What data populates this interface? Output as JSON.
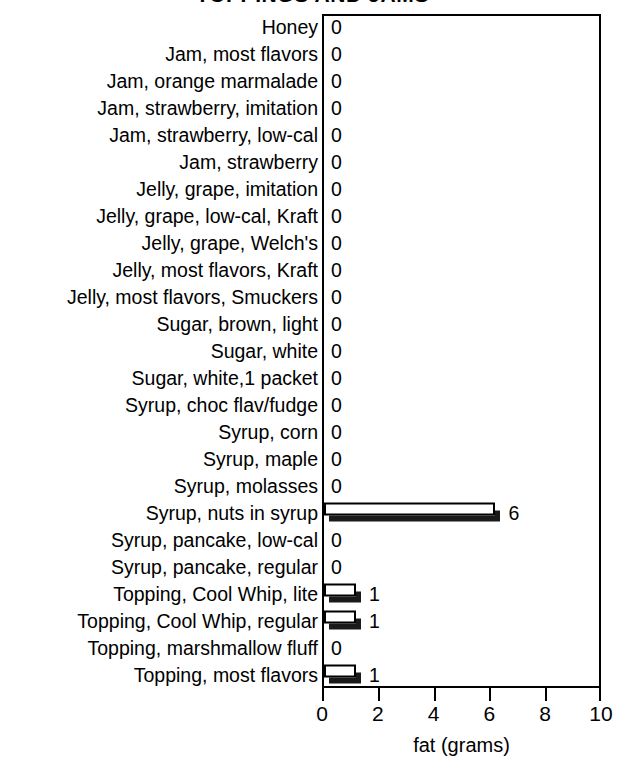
{
  "chart_data": {
    "type": "bar",
    "orientation": "horizontal",
    "title": "TOPPINGS AND JAMS",
    "xlabel": "fat (grams)",
    "ylabel": "",
    "xlim": [
      0,
      10
    ],
    "xticks": [
      0,
      2,
      4,
      6,
      8,
      10
    ],
    "xtick_labels": [
      "0",
      "2",
      "4",
      "6",
      "8",
      "10"
    ],
    "grid": false,
    "legend": false,
    "categories": [
      "Honey",
      "Jam, most flavors",
      "Jam, orange marmalade",
      "Jam, strawberry, imitation",
      "Jam, strawberry, low-cal",
      "Jam, strawberry",
      "Jelly, grape, imitation",
      "Jelly, grape, low-cal, Kraft",
      "Jelly, grape, Welch's",
      "Jelly, most flavors, Kraft",
      "Jelly, most flavors, Smuckers",
      "Sugar, brown, light",
      "Sugar, white",
      "Sugar, white,1 packet",
      "Syrup, choc flav/fudge",
      "Syrup, corn",
      "Syrup, maple",
      "Syrup, molasses",
      "Syrup, nuts in syrup",
      "Syrup, pancake, low-cal",
      "Syrup, pancake, regular",
      "Topping, Cool Whip, lite",
      "Topping, Cool Whip, regular",
      "Topping, marshmallow fluff",
      "Topping, most flavors"
    ],
    "values": [
      0,
      0,
      0,
      0,
      0,
      0,
      0,
      0,
      0,
      0,
      0,
      0,
      0,
      0,
      0,
      0,
      0,
      0,
      6,
      0,
      0,
      1,
      1,
      0,
      1
    ],
    "data_labels": [
      "0",
      "0",
      "0",
      "0",
      "0",
      "0",
      "0",
      "0",
      "0",
      "0",
      "0",
      "0",
      "0",
      "0",
      "0",
      "0",
      "0",
      "0",
      "6",
      "0",
      "0",
      "1",
      "1",
      "0",
      "1"
    ],
    "colors": {
      "bar_face": "#ffffff",
      "bar_outline": "#000000",
      "bar_shadow": "#1a1a1a",
      "axis": "#000000",
      "text": "#000000",
      "background": "#ffffff"
    }
  }
}
